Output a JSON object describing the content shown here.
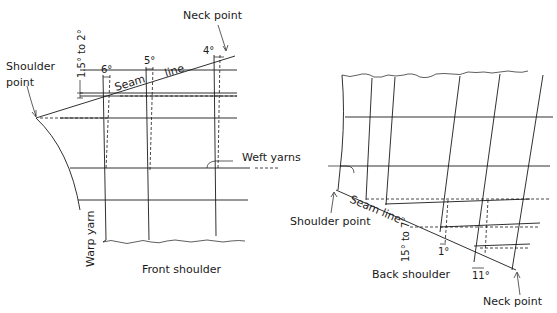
{
  "diagram": {
    "front": {
      "caption": "Front shoulder",
      "neck_point": "Neck point",
      "shoulder_point": [
        "Shoulder",
        "point"
      ],
      "seam_word1": "Seam",
      "seam_word2": "line",
      "drop_label": "1.5° to 2°",
      "angles": [
        "6°",
        "5°",
        "4°"
      ],
      "warp_label": "Warp yarn",
      "weft_label": "Weft yarns"
    },
    "back": {
      "caption": "Back shoulder",
      "neck_point": "Neck point",
      "shoulder_point": "Shoulder point",
      "seam_label": "Seam line",
      "drop_label": "15° to 7°",
      "angles": [
        "1°",
        "11°"
      ]
    },
    "colors": {
      "ink": "#1a1a1a",
      "background": "#ffffff"
    }
  }
}
